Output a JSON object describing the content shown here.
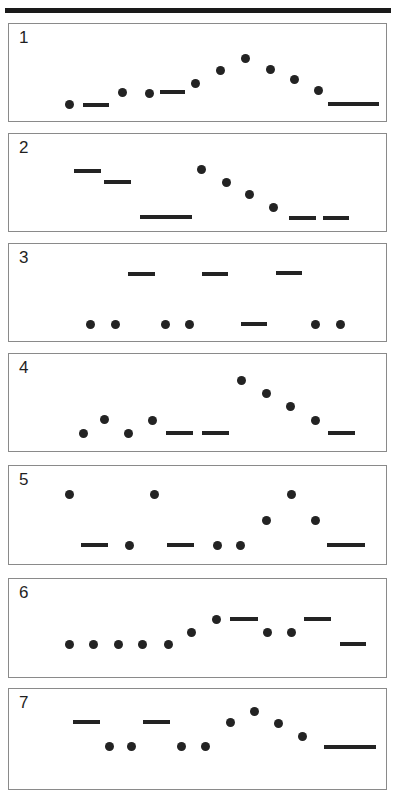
{
  "figure": {
    "title_rule": "top-divider",
    "marker_color": "#232323",
    "panel_border_color": "#8a8a8a",
    "background_color": "#ffffff",
    "dot_diameter": 9,
    "dash_height": 4
  },
  "chart_data": {
    "type": "scatter",
    "title": "",
    "xlabel": "",
    "ylabel": "",
    "grid": false,
    "legend": null,
    "panel_count": 7,
    "marker_types": [
      "dot",
      "dash"
    ],
    "panels": [
      {
        "label": "1",
        "box": {
          "x": 8,
          "y": 23,
          "w": 379,
          "h": 99
        },
        "markers": [
          {
            "type": "dot",
            "cx": 68,
            "cy": 103
          },
          {
            "type": "dash",
            "cx": 95,
            "cy": 104,
            "w": 26
          },
          {
            "type": "dot",
            "cx": 121,
            "cy": 91
          },
          {
            "type": "dot",
            "cx": 148,
            "cy": 92
          },
          {
            "type": "dash",
            "cx": 171,
            "cy": 91,
            "w": 25
          },
          {
            "type": "dot",
            "cx": 194,
            "cy": 82
          },
          {
            "type": "dot",
            "cx": 219,
            "cy": 69
          },
          {
            "type": "dot",
            "cx": 244,
            "cy": 57
          },
          {
            "type": "dot",
            "cx": 269,
            "cy": 68
          },
          {
            "type": "dot",
            "cx": 293,
            "cy": 78
          },
          {
            "type": "dot",
            "cx": 317,
            "cy": 89
          },
          {
            "type": "dash",
            "cx": 352,
            "cy": 103,
            "w": 51
          }
        ]
      },
      {
        "label": "2",
        "box": {
          "x": 8,
          "y": 133,
          "w": 379,
          "h": 99
        },
        "markers": [
          {
            "type": "dash",
            "cx": 86,
            "cy": 170,
            "w": 27
          },
          {
            "type": "dash",
            "cx": 116,
            "cy": 181,
            "w": 27
          },
          {
            "type": "dash",
            "cx": 165,
            "cy": 216,
            "w": 52
          },
          {
            "type": "dot",
            "cx": 200,
            "cy": 168
          },
          {
            "type": "dot",
            "cx": 225,
            "cy": 181
          },
          {
            "type": "dot",
            "cx": 248,
            "cy": 193
          },
          {
            "type": "dot",
            "cx": 272,
            "cy": 206
          },
          {
            "type": "dash",
            "cx": 301,
            "cy": 217,
            "w": 27
          },
          {
            "type": "dash",
            "cx": 335,
            "cy": 217,
            "w": 26
          }
        ]
      },
      {
        "label": "3",
        "box": {
          "x": 8,
          "y": 243,
          "w": 379,
          "h": 99
        },
        "markers": [
          {
            "type": "dash",
            "cx": 140,
            "cy": 273,
            "w": 27
          },
          {
            "type": "dash",
            "cx": 214,
            "cy": 273,
            "w": 26
          },
          {
            "type": "dash",
            "cx": 288,
            "cy": 272,
            "w": 26
          },
          {
            "type": "dot",
            "cx": 89,
            "cy": 323
          },
          {
            "type": "dot",
            "cx": 114,
            "cy": 323
          },
          {
            "type": "dot",
            "cx": 164,
            "cy": 323
          },
          {
            "type": "dot",
            "cx": 188,
            "cy": 323
          },
          {
            "type": "dash",
            "cx": 253,
            "cy": 323,
            "w": 26
          },
          {
            "type": "dot",
            "cx": 314,
            "cy": 323
          },
          {
            "type": "dot",
            "cx": 339,
            "cy": 323
          }
        ]
      },
      {
        "label": "4",
        "box": {
          "x": 8,
          "y": 353,
          "w": 379,
          "h": 99
        },
        "markers": [
          {
            "type": "dot",
            "cx": 82,
            "cy": 432
          },
          {
            "type": "dot",
            "cx": 103,
            "cy": 418
          },
          {
            "type": "dot",
            "cx": 127,
            "cy": 432
          },
          {
            "type": "dot",
            "cx": 151,
            "cy": 419
          },
          {
            "type": "dash",
            "cx": 178,
            "cy": 432,
            "w": 27
          },
          {
            "type": "dash",
            "cx": 214,
            "cy": 432,
            "w": 27
          },
          {
            "type": "dot",
            "cx": 240,
            "cy": 379
          },
          {
            "type": "dot",
            "cx": 265,
            "cy": 392
          },
          {
            "type": "dot",
            "cx": 289,
            "cy": 405
          },
          {
            "type": "dot",
            "cx": 314,
            "cy": 419
          },
          {
            "type": "dash",
            "cx": 340,
            "cy": 432,
            "w": 27
          }
        ]
      },
      {
        "label": "5",
        "box": {
          "x": 8,
          "y": 465,
          "w": 379,
          "h": 100
        },
        "markers": [
          {
            "type": "dot",
            "cx": 68,
            "cy": 493
          },
          {
            "type": "dash",
            "cx": 93,
            "cy": 544,
            "w": 27
          },
          {
            "type": "dot",
            "cx": 128,
            "cy": 544
          },
          {
            "type": "dot",
            "cx": 153,
            "cy": 493
          },
          {
            "type": "dash",
            "cx": 179,
            "cy": 544,
            "w": 27
          },
          {
            "type": "dot",
            "cx": 216,
            "cy": 544
          },
          {
            "type": "dot",
            "cx": 239,
            "cy": 544
          },
          {
            "type": "dot",
            "cx": 265,
            "cy": 519
          },
          {
            "type": "dot",
            "cx": 290,
            "cy": 493
          },
          {
            "type": "dot",
            "cx": 314,
            "cy": 519
          },
          {
            "type": "dash",
            "cx": 345,
            "cy": 544,
            "w": 38
          }
        ]
      },
      {
        "label": "6",
        "box": {
          "x": 8,
          "y": 578,
          "w": 379,
          "h": 100
        },
        "markers": [
          {
            "type": "dot",
            "cx": 68,
            "cy": 643
          },
          {
            "type": "dot",
            "cx": 92,
            "cy": 643
          },
          {
            "type": "dot",
            "cx": 117,
            "cy": 643
          },
          {
            "type": "dot",
            "cx": 141,
            "cy": 643
          },
          {
            "type": "dot",
            "cx": 167,
            "cy": 643
          },
          {
            "type": "dot",
            "cx": 190,
            "cy": 631
          },
          {
            "type": "dot",
            "cx": 215,
            "cy": 618
          },
          {
            "type": "dash",
            "cx": 243,
            "cy": 618,
            "w": 28
          },
          {
            "type": "dot",
            "cx": 266,
            "cy": 631
          },
          {
            "type": "dot",
            "cx": 290,
            "cy": 631
          },
          {
            "type": "dash",
            "cx": 316,
            "cy": 618,
            "w": 27
          },
          {
            "type": "dash",
            "cx": 352,
            "cy": 643,
            "w": 26
          }
        ]
      },
      {
        "label": "7",
        "box": {
          "x": 8,
          "y": 688,
          "w": 379,
          "h": 102
        },
        "markers": [
          {
            "type": "dash",
            "cx": 85,
            "cy": 721,
            "w": 27
          },
          {
            "type": "dot",
            "cx": 108,
            "cy": 745
          },
          {
            "type": "dot",
            "cx": 130,
            "cy": 745
          },
          {
            "type": "dash",
            "cx": 155,
            "cy": 721,
            "w": 27
          },
          {
            "type": "dot",
            "cx": 180,
            "cy": 745
          },
          {
            "type": "dot",
            "cx": 204,
            "cy": 745
          },
          {
            "type": "dot",
            "cx": 229,
            "cy": 721
          },
          {
            "type": "dot",
            "cx": 253,
            "cy": 710
          },
          {
            "type": "dot",
            "cx": 277,
            "cy": 722
          },
          {
            "type": "dot",
            "cx": 301,
            "cy": 735
          },
          {
            "type": "dash",
            "cx": 349,
            "cy": 746,
            "w": 52
          }
        ]
      }
    ]
  }
}
